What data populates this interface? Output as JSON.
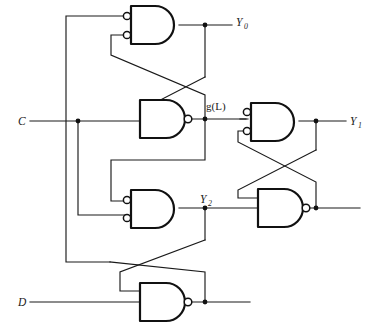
{
  "figure": {
    "background_color": "#ffffff",
    "line_color": "#1a1a1a",
    "width": 377,
    "height": 328
  },
  "inputs": [
    {
      "id": "input-c",
      "label": "C",
      "style": "italic",
      "x": 18,
      "y": 121
    },
    {
      "id": "input-d",
      "label": "D",
      "style": "italic",
      "x": 18,
      "y": 302
    }
  ],
  "outputs": [
    {
      "id": "output-y0",
      "label": "Y",
      "subscript": "0",
      "x": 238,
      "y": 22
    },
    {
      "id": "output-y1",
      "label": "Y",
      "subscript": "1",
      "x": 352,
      "y": 121
    },
    {
      "id": "output-y2",
      "label": "Y",
      "subscript": "2",
      "x": 202,
      "y": 198
    }
  ],
  "signals": [
    {
      "id": "signal-gl",
      "label": "g(L)",
      "style": "plain",
      "x": 205,
      "y": 106
    }
  ],
  "gates": [
    {
      "id": "gate-y0",
      "type": "and-inverted-inputs",
      "inputs": 2,
      "input_bubbles": true,
      "output_bubble": false,
      "x": 131,
      "y": 6,
      "w": 48,
      "h": 38
    },
    {
      "id": "gate-gl",
      "type": "nand",
      "inputs": 2,
      "input_bubbles": false,
      "output_bubble": true,
      "x": 140,
      "y": 100,
      "w": 45,
      "h": 38
    },
    {
      "id": "gate-y1",
      "type": "and-inverted-inputs",
      "inputs": 2,
      "input_bubbles": true,
      "output_bubble": false,
      "x": 251,
      "y": 103,
      "w": 48,
      "h": 38
    },
    {
      "id": "gate-y2",
      "type": "and-inverted-inputs",
      "inputs": 2,
      "input_bubbles": true,
      "output_bubble": false,
      "x": 131,
      "y": 190,
      "w": 48,
      "h": 38
    },
    {
      "id": "gate-lower-right-nand",
      "type": "nand",
      "inputs": 2,
      "input_bubbles": false,
      "output_bubble": true,
      "x": 258,
      "y": 189,
      "w": 45,
      "h": 38
    },
    {
      "id": "gate-bottom-nand",
      "type": "nand",
      "inputs": 2,
      "input_bubbles": false,
      "output_bubble": true,
      "x": 140,
      "y": 281,
      "w": 45,
      "h": 38
    }
  ],
  "junction_count": 9,
  "crossings": [
    {
      "id": "crossing-upper",
      "between": [
        "gate-y0",
        "gate-gl"
      ]
    },
    {
      "id": "crossing-lower",
      "between": [
        "gate-y2",
        "gate-bottom-nand"
      ]
    },
    {
      "id": "crossing-right",
      "between": [
        "gate-y1",
        "gate-lower-right-nand"
      ]
    }
  ]
}
